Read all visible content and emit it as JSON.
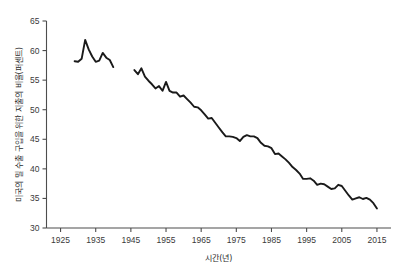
{
  "chart_data": {
    "type": "line",
    "title": "",
    "xlabel": "시간(년)",
    "ylabel": "미국의 밀 수출 구입을 위한 지출의 비율(퍼센트)",
    "xlim": [
      1921,
      2019
    ],
    "ylim": [
      30,
      65
    ],
    "xticks": [
      1925,
      1935,
      1945,
      1955,
      1965,
      1975,
      1985,
      1995,
      2005,
      2015
    ],
    "yticks": [
      30,
      35,
      40,
      45,
      50,
      55,
      60,
      65
    ],
    "grid": false,
    "legend": null,
    "line_color": "#1a1a1a",
    "axis_color": "#4d4d4d",
    "series": [
      {
        "name": "segment-1",
        "x": [
          1929,
          1930,
          1931,
          1932,
          1933,
          1934,
          1935,
          1936,
          1937,
          1938,
          1939,
          1940
        ],
        "values": [
          58.2,
          58.1,
          58.6,
          61.8,
          60.2,
          59.0,
          58.1,
          58.3,
          59.6,
          58.8,
          58.4,
          57.2
        ]
      },
      {
        "name": "segment-2",
        "x": [
          1946,
          1947,
          1948,
          1949,
          1950,
          1951,
          1952,
          1953,
          1954,
          1955,
          1956,
          1957,
          1958,
          1959,
          1960,
          1961,
          1962,
          1963,
          1964,
          1965,
          1966,
          1967,
          1968,
          1969,
          1970,
          1971,
          1972,
          1973,
          1974,
          1975,
          1976,
          1977,
          1978,
          1979,
          1980,
          1981,
          1982,
          1983,
          1984,
          1985,
          1986,
          1987,
          1988,
          1989,
          1990,
          1991,
          1992,
          1993,
          1994,
          1995,
          1996,
          1997,
          1998,
          1999,
          2000,
          2001,
          2002,
          2003,
          2004,
          2005,
          2006,
          2007,
          2008,
          2009,
          2010,
          2011,
          2012,
          2013,
          2014,
          2015
        ],
        "values": [
          56.7,
          56.0,
          57.0,
          55.6,
          54.9,
          54.3,
          53.6,
          54.0,
          53.2,
          54.7,
          53.2,
          52.9,
          52.9,
          52.2,
          52.4,
          51.8,
          51.2,
          50.5,
          50.4,
          49.9,
          49.2,
          48.5,
          48.6,
          47.8,
          47.0,
          46.2,
          45.5,
          45.5,
          45.4,
          45.2,
          44.7,
          45.4,
          45.7,
          45.5,
          45.5,
          45.2,
          44.4,
          43.9,
          43.8,
          43.5,
          42.5,
          42.6,
          42.1,
          41.6,
          41.0,
          40.3,
          39.8,
          39.2,
          38.3,
          38.3,
          38.4,
          38.0,
          37.3,
          37.5,
          37.4,
          37.0,
          36.6,
          36.7,
          37.3,
          37.1,
          36.3,
          35.5,
          34.8,
          35.0,
          35.2,
          34.9,
          35.1,
          34.8,
          34.2,
          33.3
        ]
      }
    ]
  }
}
